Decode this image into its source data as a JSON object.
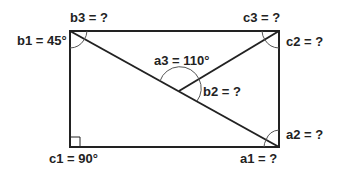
{
  "diagram": {
    "type": "geometry",
    "labels": {
      "b1": "b1 = 45°",
      "b3": "b3 = ?",
      "c3": "c3 = ?",
      "c2": "c2 = ?",
      "a3": "a3 = 110°",
      "b2": "b2 = ?",
      "a2": "a2 = ?",
      "c1": "c1 = 90°",
      "a1": "a1 = ?"
    },
    "colors": {
      "line": "#222222",
      "arc": "#555555",
      "background": "#ffffff"
    }
  }
}
